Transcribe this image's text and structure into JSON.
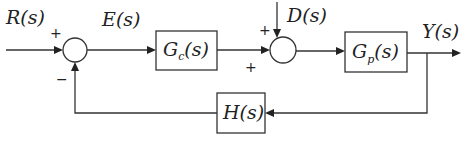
{
  "diagram": {
    "type": "feedback-control-block-diagram",
    "signals": {
      "reference": {
        "name": "R",
        "arg": "(s)"
      },
      "error": {
        "name": "E",
        "arg": "(s)"
      },
      "disturbance": {
        "name": "D",
        "arg": "(s)"
      },
      "output": {
        "name": "Y",
        "arg": "(s)"
      }
    },
    "blocks": {
      "controller": {
        "name": "G",
        "sub": "c",
        "arg": "(s)"
      },
      "plant": {
        "name": "G",
        "sub": "p",
        "arg": "(s)"
      },
      "feedback": {
        "name": "H",
        "arg": "(s)"
      }
    },
    "summing_junctions": {
      "sum1": {
        "top_sign": "+",
        "bottom_sign": "−"
      },
      "sum2": {
        "top_sign": "+",
        "bottom_sign": "+"
      }
    },
    "colors": {
      "line": "#333333",
      "background": "#ffffff"
    }
  }
}
